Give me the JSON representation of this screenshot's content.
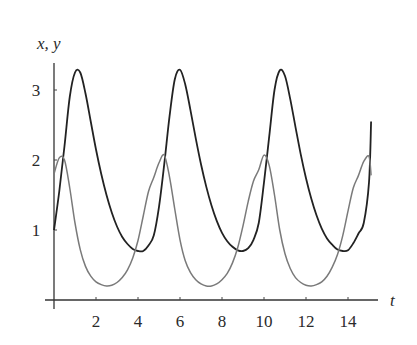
{
  "chart_data": {
    "type": "line",
    "title": "",
    "xlabel": "t",
    "ylabel": "x, y",
    "xlim": [
      0,
      15.5
    ],
    "ylim": [
      0,
      3.4
    ],
    "xticks": [
      2,
      4,
      6,
      8,
      10,
      12,
      14
    ],
    "yticks": [
      1,
      2,
      3
    ],
    "xtick_labels": [
      "2",
      "4",
      "6",
      "8",
      "10",
      "12",
      "14"
    ],
    "ytick_labels": [
      "1",
      "2",
      "3"
    ],
    "grid": false,
    "legend": null,
    "x": [
      0,
      0.25,
      0.5,
      0.75,
      1,
      1.25,
      1.5,
      1.75,
      2,
      2.25,
      2.5,
      2.75,
      3,
      3.25,
      3.5,
      3.75,
      4,
      4.25,
      4.5,
      4.75,
      5,
      5.25,
      5.5,
      5.75,
      6,
      6.25,
      6.5,
      6.75,
      7,
      7.25,
      7.5,
      7.75,
      8,
      8.25,
      8.5,
      8.75,
      9,
      9.25,
      9.5,
      9.75,
      10,
      10.25,
      10.5,
      10.75,
      11,
      11.25,
      11.5,
      11.75,
      12,
      12.25,
      12.5,
      12.75,
      13,
      13.25,
      13.5,
      13.75,
      14,
      14.25,
      14.5,
      14.75,
      15,
      15.1
    ],
    "series": [
      {
        "name": "x",
        "color": "#222222",
        "values": [
          1.0,
          1.55,
          2.2,
          2.9,
          3.25,
          3.25,
          2.95,
          2.55,
          2.15,
          1.8,
          1.5,
          1.25,
          1.05,
          0.9,
          0.8,
          0.73,
          0.7,
          0.7,
          0.78,
          0.92,
          1.33,
          1.94,
          2.62,
          3.15,
          3.29,
          3.08,
          2.71,
          2.31,
          1.94,
          1.62,
          1.35,
          1.13,
          0.96,
          0.84,
          0.76,
          0.71,
          0.7,
          0.74,
          0.86,
          1.1,
          1.68,
          2.34,
          3.0,
          3.28,
          3.2,
          2.87,
          2.47,
          2.08,
          1.74,
          1.45,
          1.21,
          1.02,
          0.88,
          0.79,
          0.72,
          0.7,
          0.71,
          0.81,
          0.95,
          1.1,
          1.68,
          2.55
        ]
      },
      {
        "name": "y",
        "color": "#7a7a7a",
        "values": [
          1.8,
          2.03,
          2.0,
          1.6,
          1.1,
          0.72,
          0.48,
          0.34,
          0.26,
          0.22,
          0.2,
          0.21,
          0.25,
          0.32,
          0.43,
          0.6,
          0.85,
          1.2,
          1.55,
          1.75,
          1.96,
          2.07,
          1.76,
          1.3,
          0.86,
          0.56,
          0.39,
          0.29,
          0.23,
          0.2,
          0.2,
          0.23,
          0.29,
          0.38,
          0.53,
          0.75,
          1.06,
          1.41,
          1.7,
          1.86,
          2.07,
          1.92,
          1.5,
          1.0,
          0.66,
          0.45,
          0.32,
          0.25,
          0.21,
          0.2,
          0.22,
          0.26,
          0.34,
          0.47,
          0.65,
          0.92,
          1.27,
          1.6,
          1.78,
          1.98,
          2.05,
          1.78
        ]
      }
    ]
  }
}
